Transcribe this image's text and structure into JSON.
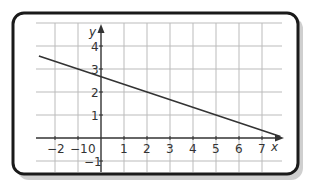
{
  "chart_data": {
    "type": "line",
    "title": "",
    "xlabel": "x",
    "ylabel": "y",
    "xlim": [
      -2.7,
      7.9
    ],
    "ylim": [
      -1.3,
      5
    ],
    "x_ticks": [
      -2,
      -1,
      0,
      1,
      2,
      3,
      4,
      5,
      6,
      7
    ],
    "y_ticks": [
      -1,
      0,
      1,
      2,
      3,
      4
    ],
    "x_tick_labels": [
      "−2",
      "−1",
      "0",
      "1",
      "2",
      "3",
      "4",
      "5",
      "6",
      "7"
    ],
    "y_tick_labels": [
      "−1",
      "1",
      "2",
      "3",
      "4"
    ],
    "grid": true,
    "series": [
      {
        "name": "line",
        "equation": "y = -x/3 + 8/3",
        "x": [
          -2.7,
          -1,
          2,
          5,
          7.8
        ],
        "y": [
          3.57,
          3,
          2,
          1,
          0.07
        ]
      }
    ],
    "colors": {
      "line": "#333333",
      "grid": "#bbbbbb",
      "axis": "#333333",
      "frame": "#1a1a1a",
      "shadow": "#c8c8c8"
    }
  }
}
